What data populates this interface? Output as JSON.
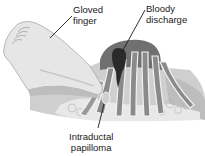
{
  "diagram": {
    "labels": {
      "gloved_finger": {
        "line1": "Gloved",
        "line2": "finger"
      },
      "bloody_discharge": {
        "line1": "Bloody",
        "line2": "discharge"
      },
      "intraductal_papilloma": {
        "line1": "Intraductal",
        "line2": "papilloma"
      }
    },
    "colors": {
      "background": "#ffffff",
      "glove": "#e6e6e6",
      "glove_shadow": "#bdbdbd",
      "areola": "#6e6e6e",
      "ducts": "#8a8a8a",
      "duct_walls": "#f0f0f0",
      "discharge": "#2a2a2a",
      "tissue": "#d4d4d4",
      "leader_line": "#1a1a1a"
    }
  }
}
